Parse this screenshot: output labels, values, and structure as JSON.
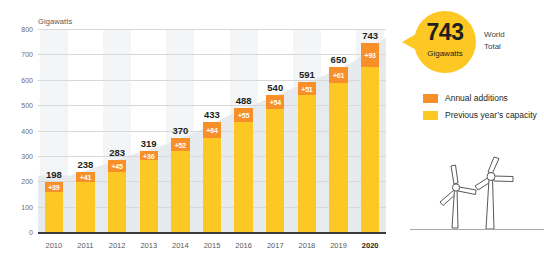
{
  "chart_data": {
    "type": "bar",
    "title": "",
    "subtitle": "",
    "xlabel": "",
    "ylabel": "Gigawatts",
    "ylim": [
      0,
      800
    ],
    "yticks": [
      0,
      100,
      200,
      300,
      400,
      500,
      600,
      700,
      800
    ],
    "ytick_labels": [
      "0",
      "100",
      "200",
      "300",
      "400",
      "500",
      "600",
      "700",
      "800"
    ],
    "grid": true,
    "legend_position": "right",
    "categories": [
      "2010",
      "2011",
      "2012",
      "2013",
      "2014",
      "2015",
      "2016",
      "2017",
      "2018",
      "2019",
      "2020"
    ],
    "totals": [
      198,
      238,
      283,
      319,
      370,
      433,
      488,
      540,
      591,
      650,
      743
    ],
    "total_labels": [
      "198",
      "238",
      "283",
      "319",
      "370",
      "433",
      "488",
      "540",
      "591",
      "650",
      "743"
    ],
    "additions": [
      39,
      41,
      45,
      36,
      52,
      64,
      55,
      54,
      51,
      61,
      93
    ],
    "addition_labels": [
      "+39",
      "+41",
      "+45",
      "+36",
      "+52",
      "+64",
      "+55",
      "+54",
      "+51",
      "+61",
      "+93"
    ],
    "series": [
      {
        "name": "Previous year's capacity",
        "color": "#fdc823",
        "values": [
          159,
          197,
          238,
          283,
          318,
          369,
          433,
          486,
          540,
          589,
          650
        ]
      },
      {
        "name": "Annual additions",
        "color": "#f79029",
        "values": [
          39,
          41,
          45,
          36,
          52,
          64,
          55,
          54,
          51,
          61,
          93
        ]
      }
    ],
    "emphasized_category": "2020"
  },
  "axis": {
    "unit_label": "Gigawatts"
  },
  "callout": {
    "value": "743",
    "unit": "Gigawatts",
    "side_line_1": "World",
    "side_line_2": "Total"
  },
  "legend": {
    "items": [
      {
        "label": "Annual additions",
        "color": "#f79029",
        "icon": "color-swatch"
      },
      {
        "label": "Previous year’s capacity",
        "color": "#fdc823",
        "icon": "color-swatch"
      }
    ]
  },
  "illustration": {
    "name": "wind-turbines",
    "count": 2
  },
  "colors": {
    "annual_additions": "#f79029",
    "previous_capacity": "#fdc823",
    "callout_bubble": "#fdc823",
    "grid": "#d8d8d8",
    "axis": "#3b3b3d",
    "band": "#e9ecee",
    "text": "#231f20"
  }
}
